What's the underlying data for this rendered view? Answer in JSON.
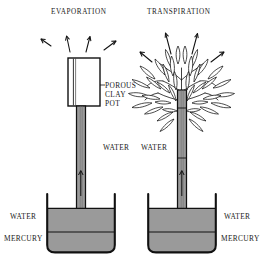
{
  "figure": {
    "title_left": "EVAPORATION",
    "title_right": "TRANSPIRATION",
    "background_color": "#ffffff",
    "ink_color": "#111111",
    "fill_color": "#9a9a9a",
    "labels": {
      "porous_line1": "POROUS",
      "porous_line2": "CLAY",
      "porous_line3": "POT",
      "water_tube_left": "WATER",
      "water_tube_right": "WATER",
      "water_basin_left": "WATER",
      "mercury_basin_left": "MERCURY",
      "water_basin_right": "WATER",
      "mercury_basin_right": "MERCURY"
    },
    "apparatus": {
      "left_name": "evaporation-potometer",
      "right_name": "transpiration-potometer",
      "left_top_element": "porous-clay-pot",
      "right_top_element": "leafy-plant",
      "liquid_layers": [
        "WATER",
        "MERCURY"
      ],
      "vapor_arrow_count_left": 4,
      "vapor_arrow_count_right": 4,
      "flow_arrow_direction": "up"
    }
  }
}
